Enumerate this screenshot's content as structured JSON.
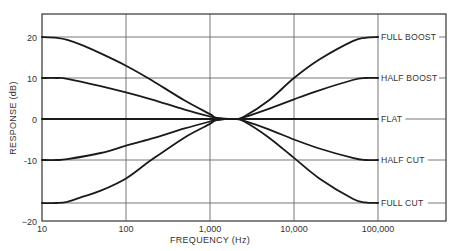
{
  "chart_data": {
    "type": "line",
    "title": "",
    "xlabel": "FREQUENCY (Hz)",
    "ylabel": "RESPONSE (dB)",
    "x_scale": "log",
    "xlim": [
      10,
      100000
    ],
    "ylim": [
      -20,
      25
    ],
    "grid": true,
    "x_ticks": [
      {
        "value": 10,
        "label": "10"
      },
      {
        "value": 100,
        "label": "100"
      },
      {
        "value": 1000,
        "label": "1,000"
      },
      {
        "value": 10000,
        "label": "10,000"
      },
      {
        "value": 100000,
        "label": "100,000"
      }
    ],
    "y_ticks": [
      {
        "value": 20,
        "label": "20"
      },
      {
        "value": 10,
        "label": "10"
      },
      {
        "value": 0,
        "label": "0"
      },
      {
        "value": -10,
        "label": "-10"
      },
      {
        "value": -20,
        "label": "−20"
      }
    ],
    "legend_position": "right (inline labels at curve ends)",
    "series": [
      {
        "name": "FULL BOOST",
        "x": [
          10,
          15,
          20,
          30,
          50,
          100,
          200,
          500,
          1000,
          1200,
          2000,
          2500,
          5000,
          10000,
          20000,
          50000,
          70000,
          100000
        ],
        "y": [
          20,
          19.8,
          19.3,
          18,
          16,
          13,
          9.5,
          4.5,
          1.2,
          0.3,
          0,
          0.5,
          4.5,
          10,
          14.5,
          19,
          19.8,
          20
        ]
      },
      {
        "name": "HALF BOOST",
        "x": [
          10,
          15,
          20,
          50,
          100,
          200,
          500,
          1000,
          1200,
          2000,
          2500,
          5000,
          10000,
          20000,
          50000,
          70000,
          100000
        ],
        "y": [
          10,
          10,
          9.8,
          8,
          6.5,
          4.8,
          2.3,
          0.6,
          0.2,
          0,
          0.4,
          2.5,
          4.8,
          7,
          9.5,
          10,
          10
        ]
      },
      {
        "name": "FLAT",
        "x": [
          10,
          100000
        ],
        "y": [
          0,
          0
        ]
      },
      {
        "name": "HALF CUT",
        "x": [
          10,
          15,
          20,
          50,
          100,
          200,
          500,
          1000,
          1200,
          2000,
          2500,
          5000,
          10000,
          20000,
          50000,
          70000,
          100000
        ],
        "y": [
          -10,
          -10,
          -9.8,
          -8.3,
          -6.5,
          -4.8,
          -2.3,
          -0.6,
          -0.2,
          0,
          -0.4,
          -2.5,
          -5,
          -7.2,
          -9.5,
          -10,
          -10
        ]
      },
      {
        "name": "FULL CUT",
        "x": [
          10,
          15,
          20,
          30,
          50,
          100,
          200,
          500,
          1000,
          1200,
          2000,
          2500,
          5000,
          10000,
          20000,
          50000,
          70000,
          100000
        ],
        "y": [
          -17,
          -17,
          -16.8,
          -16,
          -15,
          -13,
          -10,
          -4.5,
          -1.2,
          -0.3,
          0,
          -0.5,
          -4.5,
          -9.5,
          -13,
          -16.3,
          -16.9,
          -17
        ]
      }
    ]
  },
  "labels": {
    "xlabel": "FREQUENCY (Hz)",
    "ylabel": "RESPONSE (dB)",
    "x_ticks": [
      "10",
      "100",
      "1,000",
      "10,000",
      "100,000"
    ],
    "y_ticks": [
      "20",
      "10",
      "0",
      "−10",
      "−20"
    ],
    "legend": [
      "FULL BOOST",
      "HALF BOOST",
      "FLAT",
      "HALF CUT",
      "FULL CUT"
    ]
  },
  "colors": {
    "curve": "#1a1a1a",
    "grid": "#555555",
    "frame": "#333333",
    "text": "#333333",
    "background": "#ffffff"
  }
}
